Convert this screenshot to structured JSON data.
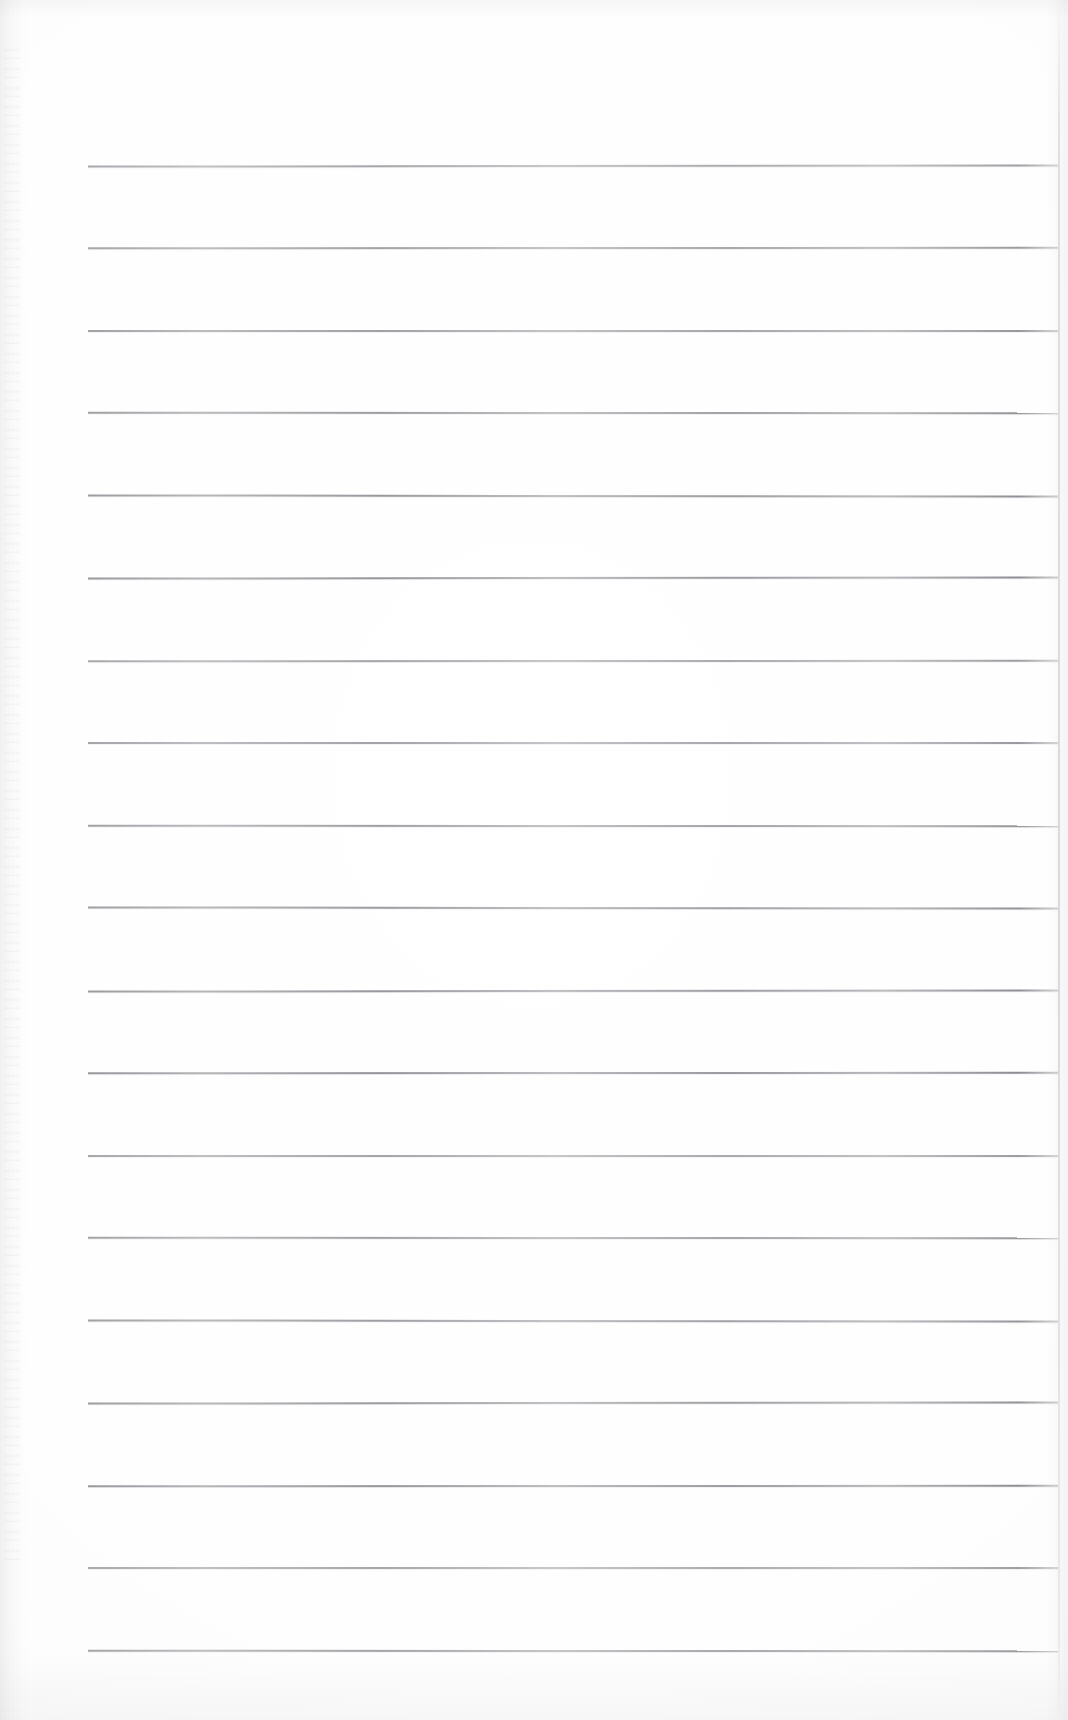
{
  "document": {
    "kind": "scanned-ruled-notebook-page",
    "title": "",
    "page_width": 1068,
    "page_height": 1720,
    "background_color": "#ffffff",
    "has_text": false,
    "text_content": "",
    "notes": "Blank scanned sheet of ruled paper; no handwriting, printing, headings, page numbers or marginalia are visible."
  },
  "ruling": {
    "line_color": "#6e7076",
    "line_count": 19,
    "line_thickness_px": 2,
    "first_line_y": 165,
    "line_spacing_px": 82.5,
    "line_start_x": 88,
    "line_end_x": 1058,
    "lines": [
      {
        "index": 1,
        "y": 165
      },
      {
        "index": 2,
        "y": 247
      },
      {
        "index": 3,
        "y": 330
      },
      {
        "index": 4,
        "y": 412
      },
      {
        "index": 5,
        "y": 495
      },
      {
        "index": 6,
        "y": 577
      },
      {
        "index": 7,
        "y": 660
      },
      {
        "index": 8,
        "y": 742
      },
      {
        "index": 9,
        "y": 825
      },
      {
        "index": 10,
        "y": 907
      },
      {
        "index": 11,
        "y": 990
      },
      {
        "index": 12,
        "y": 1072
      },
      {
        "index": 13,
        "y": 1155
      },
      {
        "index": 14,
        "y": 1237
      },
      {
        "index": 15,
        "y": 1320
      },
      {
        "index": 16,
        "y": 1402
      },
      {
        "index": 17,
        "y": 1485
      },
      {
        "index": 18,
        "y": 1567
      },
      {
        "index": 19,
        "y": 1650
      }
    ]
  },
  "margins": {
    "top_blank_px": 165,
    "bottom_blank_px": 70,
    "left_blank_px": 88,
    "right_blank_px": 10
  },
  "scan_artifacts": {
    "left_edge_shading": true,
    "right_edge_crease": true,
    "top_edge_shading": true,
    "bottom_edge_shading": true,
    "grain": true
  }
}
